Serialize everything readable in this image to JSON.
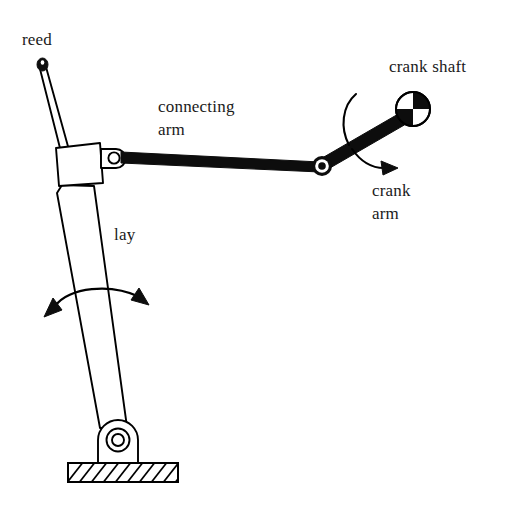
{
  "diagram": {
    "background_color": "#ffffff",
    "ink_color": "#000000",
    "width": 510,
    "height": 516,
    "labels": {
      "reed": "reed",
      "connecting_arm_line1": "connecting",
      "connecting_arm_line2": "arm",
      "crank_shaft": "crank shaft",
      "crank_arm_line1": "crank",
      "crank_arm_line2": "arm",
      "lay": "lay"
    },
    "parts": [
      {
        "id": "reed",
        "name": "reed",
        "description": "thin vertical slat with rounded dark tip, tilted right, rising from the lay block",
        "style": "outline",
        "tip": {
          "x": 39,
          "y": 64,
          "filled": true
        }
      },
      {
        "id": "lay-block",
        "name": "lay block",
        "description": "quadrilateral housing at top of the sword that holds the reed and the connecting-arm joint",
        "style": "outline"
      },
      {
        "id": "lay-sword",
        "name": "lay sword",
        "description": "long tapering arm swinging from the base pivot up to the lay block",
        "style": "outline"
      },
      {
        "id": "connecting-arm",
        "name": "connecting arm",
        "description": "long solid black bar from the lay block joint to the crank arm joint",
        "style": "solid"
      },
      {
        "id": "crank-arm",
        "name": "crank arm",
        "description": "short solid black bar from the connecting-arm joint up to the crank shaft",
        "style": "solid"
      },
      {
        "id": "crank-shaft",
        "name": "crank shaft",
        "description": "circle with checkered quadrants; top-right and bottom-left filled black",
        "style": "checkered-circle",
        "center": {
          "x": 413,
          "y": 109
        },
        "radius": 17
      },
      {
        "id": "lay-pivot",
        "name": "lay pivot",
        "description": "concentric-ring pin joint in a rounded bracket mounted on the hatched base",
        "center": {
          "x": 118,
          "y": 440
        }
      },
      {
        "id": "base",
        "name": "machine base",
        "description": "hatched rectangular foundation block at the bottom",
        "hatching": "diagonal"
      }
    ],
    "joints": [
      {
        "id": "lay-block-joint",
        "name": "lay block pin joint",
        "x": 112,
        "y": 157,
        "style": "hollow-ring"
      },
      {
        "id": "crank-pin-joint",
        "name": "crank pin joint",
        "x": 322,
        "y": 166,
        "style": "ring-with-black-center"
      },
      {
        "id": "lay-base-pivot",
        "name": "lay base pivot",
        "x": 118,
        "y": 440,
        "style": "concentric-rings"
      }
    ],
    "motion_arrows": [
      {
        "id": "lay-oscillation",
        "name": "lay oscillation arrow",
        "type": "double-headed-arc",
        "description": "arc crossing the lay sword with arrowheads at both ends indicating back-and-forth swing"
      },
      {
        "id": "crank-rotation",
        "name": "crank rotation arrow",
        "type": "single-headed-arc",
        "description": "arc curving around the crank arm with a single arrowhead indicating rotation direction"
      }
    ]
  }
}
